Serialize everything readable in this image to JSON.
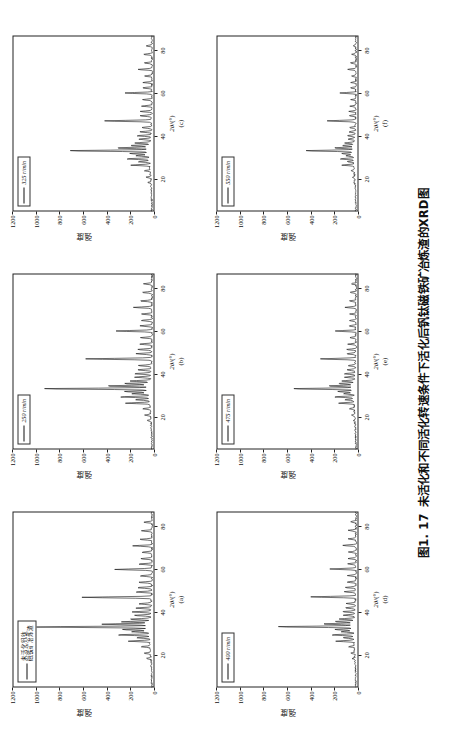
{
  "figure": {
    "caption_number": "图1. 17",
    "caption_text": "未活化和不同活化转速条件下活化后钒钛磁铁矿冶炼渣的XRD图",
    "y_axis_label": "强度",
    "x_axis_title_prefix": "2",
    "x_axis_title_symbol": "θ",
    "x_axis_title_unit": "/(°)",
    "y_ticks": [
      "1200",
      "1000",
      "800",
      "600",
      "400",
      "200",
      "0"
    ],
    "x_ticks": [
      "0",
      "20",
      "40",
      "60",
      "80"
    ]
  },
  "panels": [
    {
      "key": "a",
      "letter": "(a)",
      "legend": "未活化钒钛\n磁铁矿冶炼渣",
      "legend_is_latin": false,
      "x_axis": "2θ/(°)"
    },
    {
      "key": "b",
      "letter": "(b)",
      "legend": "250 r/min",
      "legend_is_latin": true,
      "x_axis": "2θ/(°)"
    },
    {
      "key": "c",
      "letter": "(c)",
      "legend": "325 r/min",
      "legend_is_latin": true,
      "x_axis": "2θ/(°)"
    },
    {
      "key": "d",
      "letter": "(d)",
      "legend": "400 r/min",
      "legend_is_latin": true,
      "x_axis": "2θ/(°)"
    },
    {
      "key": "e",
      "letter": "(e)",
      "legend": "475 r/min",
      "legend_is_latin": true,
      "x_axis": "2θ/(°)"
    },
    {
      "key": "f",
      "letter": "(f)",
      "legend": "550 r/min",
      "legend_is_latin": true,
      "x_axis": "2θ/(°)"
    }
  ],
  "chart_data": {
    "type": "line",
    "title": "未活化和不同活化转速条件下活化后钒钛磁铁矿冶炼渣的XRD图",
    "xlabel": "2θ/(°)",
    "ylabel": "强度",
    "xlim": [
      5,
      87
    ],
    "ylim": [
      0,
      1200
    ],
    "grid": false,
    "legend_position": "upper-left",
    "line_color": "#111111",
    "subplots": [
      {
        "panel": "a",
        "legend": "未活化钒钛磁铁矿冶炼渣",
        "peaks": [
          {
            "x": 18.5,
            "y": 60
          },
          {
            "x": 21.0,
            "y": 75
          },
          {
            "x": 24.0,
            "y": 95
          },
          {
            "x": 26.6,
            "y": 210
          },
          {
            "x": 28.2,
            "y": 140
          },
          {
            "x": 29.5,
            "y": 300
          },
          {
            "x": 31.0,
            "y": 180
          },
          {
            "x": 32.0,
            "y": 260
          },
          {
            "x": 33.2,
            "y": 1010
          },
          {
            "x": 34.5,
            "y": 430
          },
          {
            "x": 35.6,
            "y": 260
          },
          {
            "x": 36.8,
            "y": 200
          },
          {
            "x": 38.6,
            "y": 160
          },
          {
            "x": 40.2,
            "y": 175
          },
          {
            "x": 42.0,
            "y": 150
          },
          {
            "x": 44.0,
            "y": 130
          },
          {
            "x": 47.0,
            "y": 610
          },
          {
            "x": 49.5,
            "y": 160
          },
          {
            "x": 51.5,
            "y": 150
          },
          {
            "x": 54.0,
            "y": 135
          },
          {
            "x": 57.0,
            "y": 120
          },
          {
            "x": 60.0,
            "y": 330
          },
          {
            "x": 62.5,
            "y": 130
          },
          {
            "x": 65.0,
            "y": 120
          },
          {
            "x": 68.0,
            "y": 110
          },
          {
            "x": 71.0,
            "y": 180
          },
          {
            "x": 74.0,
            "y": 120
          },
          {
            "x": 78.0,
            "y": 110
          },
          {
            "x": 82.0,
            "y": 95
          }
        ]
      },
      {
        "panel": "b",
        "legend": "250 r/min",
        "peaks": [
          {
            "x": 18.5,
            "y": 55
          },
          {
            "x": 21.0,
            "y": 70
          },
          {
            "x": 24.0,
            "y": 90
          },
          {
            "x": 26.6,
            "y": 230
          },
          {
            "x": 28.2,
            "y": 150
          },
          {
            "x": 29.5,
            "y": 280
          },
          {
            "x": 31.0,
            "y": 175
          },
          {
            "x": 32.0,
            "y": 240
          },
          {
            "x": 33.3,
            "y": 960
          },
          {
            "x": 34.6,
            "y": 400
          },
          {
            "x": 35.7,
            "y": 250
          },
          {
            "x": 36.9,
            "y": 195
          },
          {
            "x": 38.7,
            "y": 155
          },
          {
            "x": 40.3,
            "y": 170
          },
          {
            "x": 42.1,
            "y": 145
          },
          {
            "x": 44.1,
            "y": 128
          },
          {
            "x": 47.2,
            "y": 580
          },
          {
            "x": 49.6,
            "y": 155
          },
          {
            "x": 51.6,
            "y": 145
          },
          {
            "x": 54.1,
            "y": 130
          },
          {
            "x": 57.1,
            "y": 118
          },
          {
            "x": 60.2,
            "y": 320
          },
          {
            "x": 62.6,
            "y": 125
          },
          {
            "x": 65.1,
            "y": 118
          },
          {
            "x": 68.1,
            "y": 108
          },
          {
            "x": 71.2,
            "y": 175
          },
          {
            "x": 74.2,
            "y": 118
          },
          {
            "x": 78.2,
            "y": 108
          },
          {
            "x": 82.2,
            "y": 92
          }
        ]
      },
      {
        "panel": "c",
        "legend": "325 r/min",
        "peaks": [
          {
            "x": 18.5,
            "y": 45
          },
          {
            "x": 21.0,
            "y": 58
          },
          {
            "x": 24.0,
            "y": 72
          },
          {
            "x": 26.6,
            "y": 185
          },
          {
            "x": 28.2,
            "y": 120
          },
          {
            "x": 29.5,
            "y": 225
          },
          {
            "x": 31.0,
            "y": 140
          },
          {
            "x": 32.0,
            "y": 195
          },
          {
            "x": 33.3,
            "y": 740
          },
          {
            "x": 34.6,
            "y": 320
          },
          {
            "x": 35.7,
            "y": 200
          },
          {
            "x": 36.9,
            "y": 160
          },
          {
            "x": 38.7,
            "y": 125
          },
          {
            "x": 40.3,
            "y": 140
          },
          {
            "x": 42.1,
            "y": 118
          },
          {
            "x": 44.1,
            "y": 105
          },
          {
            "x": 47.2,
            "y": 430
          },
          {
            "x": 49.6,
            "y": 125
          },
          {
            "x": 51.6,
            "y": 118
          },
          {
            "x": 54.1,
            "y": 105
          },
          {
            "x": 57.1,
            "y": 95
          },
          {
            "x": 60.2,
            "y": 255
          },
          {
            "x": 62.6,
            "y": 102
          },
          {
            "x": 65.1,
            "y": 95
          },
          {
            "x": 68.1,
            "y": 88
          },
          {
            "x": 71.2,
            "y": 142
          },
          {
            "x": 74.2,
            "y": 95
          },
          {
            "x": 78.2,
            "y": 88
          },
          {
            "x": 82.2,
            "y": 75
          }
        ]
      },
      {
        "panel": "d",
        "legend": "400 r/min",
        "peaks": [
          {
            "x": 18.5,
            "y": 42
          },
          {
            "x": 21.0,
            "y": 55
          },
          {
            "x": 24.0,
            "y": 68
          },
          {
            "x": 26.6,
            "y": 175
          },
          {
            "x": 28.2,
            "y": 115
          },
          {
            "x": 29.5,
            "y": 215
          },
          {
            "x": 31.0,
            "y": 132
          },
          {
            "x": 32.0,
            "y": 185
          },
          {
            "x": 33.3,
            "y": 700
          },
          {
            "x": 34.6,
            "y": 300
          },
          {
            "x": 35.7,
            "y": 190
          },
          {
            "x": 36.9,
            "y": 152
          },
          {
            "x": 38.7,
            "y": 120
          },
          {
            "x": 40.3,
            "y": 132
          },
          {
            "x": 42.1,
            "y": 112
          },
          {
            "x": 44.1,
            "y": 100
          },
          {
            "x": 47.2,
            "y": 405
          },
          {
            "x": 49.6,
            "y": 120
          },
          {
            "x": 51.6,
            "y": 112
          },
          {
            "x": 54.1,
            "y": 100
          },
          {
            "x": 57.1,
            "y": 90
          },
          {
            "x": 60.2,
            "y": 240
          },
          {
            "x": 62.6,
            "y": 97
          },
          {
            "x": 65.1,
            "y": 90
          },
          {
            "x": 68.1,
            "y": 84
          },
          {
            "x": 71.2,
            "y": 135
          },
          {
            "x": 74.2,
            "y": 90
          },
          {
            "x": 78.2,
            "y": 84
          },
          {
            "x": 82.2,
            "y": 72
          }
        ]
      },
      {
        "panel": "e",
        "legend": "475 r/min",
        "peaks": [
          {
            "x": 18.5,
            "y": 38
          },
          {
            "x": 21.0,
            "y": 48
          },
          {
            "x": 24.0,
            "y": 60
          },
          {
            "x": 26.6,
            "y": 150
          },
          {
            "x": 28.2,
            "y": 100
          },
          {
            "x": 29.5,
            "y": 185
          },
          {
            "x": 31.0,
            "y": 115
          },
          {
            "x": 32.0,
            "y": 160
          },
          {
            "x": 33.3,
            "y": 560
          },
          {
            "x": 34.6,
            "y": 250
          },
          {
            "x": 35.7,
            "y": 162
          },
          {
            "x": 36.9,
            "y": 130
          },
          {
            "x": 38.7,
            "y": 102
          },
          {
            "x": 40.3,
            "y": 114
          },
          {
            "x": 42.1,
            "y": 96
          },
          {
            "x": 44.1,
            "y": 86
          },
          {
            "x": 47.2,
            "y": 330
          },
          {
            "x": 49.6,
            "y": 102
          },
          {
            "x": 51.6,
            "y": 96
          },
          {
            "x": 54.1,
            "y": 86
          },
          {
            "x": 57.1,
            "y": 78
          },
          {
            "x": 60.2,
            "y": 200
          },
          {
            "x": 62.6,
            "y": 84
          },
          {
            "x": 65.1,
            "y": 78
          },
          {
            "x": 68.1,
            "y": 72
          },
          {
            "x": 71.2,
            "y": 115
          },
          {
            "x": 74.2,
            "y": 78
          },
          {
            "x": 78.2,
            "y": 72
          },
          {
            "x": 82.2,
            "y": 62
          }
        ]
      },
      {
        "panel": "f",
        "legend": "550 r/min",
        "peaks": [
          {
            "x": 18.5,
            "y": 30
          },
          {
            "x": 21.0,
            "y": 38
          },
          {
            "x": 24.0,
            "y": 48
          },
          {
            "x": 26.6,
            "y": 120
          },
          {
            "x": 28.2,
            "y": 80
          },
          {
            "x": 29.5,
            "y": 148
          },
          {
            "x": 31.0,
            "y": 92
          },
          {
            "x": 32.0,
            "y": 128
          },
          {
            "x": 33.3,
            "y": 450
          },
          {
            "x": 34.6,
            "y": 200
          },
          {
            "x": 35.7,
            "y": 130
          },
          {
            "x": 36.9,
            "y": 104
          },
          {
            "x": 38.7,
            "y": 82
          },
          {
            "x": 40.3,
            "y": 92
          },
          {
            "x": 42.1,
            "y": 78
          },
          {
            "x": 44.1,
            "y": 70
          },
          {
            "x": 47.2,
            "y": 260
          },
          {
            "x": 49.6,
            "y": 82
          },
          {
            "x": 51.6,
            "y": 78
          },
          {
            "x": 54.1,
            "y": 70
          },
          {
            "x": 57.1,
            "y": 64
          },
          {
            "x": 60.2,
            "y": 160
          },
          {
            "x": 62.6,
            "y": 68
          },
          {
            "x": 65.1,
            "y": 64
          },
          {
            "x": 68.1,
            "y": 58
          },
          {
            "x": 71.2,
            "y": 92
          },
          {
            "x": 74.2,
            "y": 64
          },
          {
            "x": 78.2,
            "y": 58
          },
          {
            "x": 82.2,
            "y": 50
          }
        ]
      }
    ]
  }
}
